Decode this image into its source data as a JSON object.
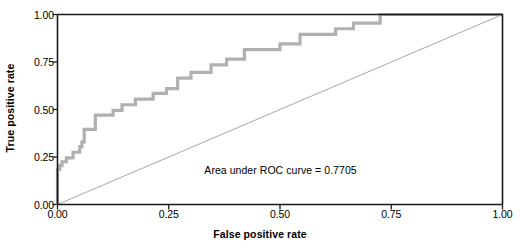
{
  "chart_data": {
    "type": "line",
    "title": "",
    "xlabel": "False positive rate",
    "ylabel": "True positive rate",
    "xlim": [
      0.0,
      1.0
    ],
    "ylim": [
      0.0,
      1.0
    ],
    "xticks": [
      "0.00",
      "0.25",
      "0.50",
      "0.75",
      "1.00"
    ],
    "xtick_values": [
      0.0,
      0.25,
      0.5,
      0.75,
      1.0
    ],
    "yticks": [
      "0.00",
      "0.25",
      "0.50",
      "0.75",
      "1.00"
    ],
    "ytick_values": [
      0.0,
      0.25,
      0.5,
      0.75,
      1.0
    ],
    "grid": false,
    "legend": "none",
    "annotation": {
      "text": "Area under ROC curve = 0.7705",
      "x": 0.33,
      "y": 0.175
    },
    "auc": 0.7705,
    "series": [
      {
        "name": "ROC curve",
        "type": "step",
        "color": "#b0b0b0",
        "linewidth": 3.2,
        "x": [
          0.0,
          0.0,
          0.0,
          0.0,
          0.0,
          0.0,
          0.0,
          0.0,
          0.005,
          0.005,
          0.01,
          0.01,
          0.02,
          0.02,
          0.035,
          0.035,
          0.05,
          0.05,
          0.055,
          0.055,
          0.06,
          0.06,
          0.085,
          0.085,
          0.125,
          0.125,
          0.145,
          0.145,
          0.175,
          0.175,
          0.215,
          0.215,
          0.245,
          0.245,
          0.27,
          0.27,
          0.3,
          0.3,
          0.345,
          0.345,
          0.38,
          0.38,
          0.42,
          0.42,
          0.5,
          0.5,
          0.545,
          0.545,
          0.625,
          0.625,
          0.665,
          0.665,
          0.725,
          0.725,
          1.0
        ],
        "y": [
          0.0,
          0.025,
          0.055,
          0.08,
          0.105,
          0.13,
          0.155,
          0.185,
          0.185,
          0.205,
          0.205,
          0.225,
          0.225,
          0.245,
          0.245,
          0.275,
          0.275,
          0.305,
          0.305,
          0.33,
          0.33,
          0.395,
          0.395,
          0.47,
          0.47,
          0.495,
          0.495,
          0.525,
          0.525,
          0.555,
          0.555,
          0.585,
          0.585,
          0.61,
          0.61,
          0.665,
          0.665,
          0.695,
          0.695,
          0.735,
          0.735,
          0.765,
          0.765,
          0.815,
          0.815,
          0.845,
          0.845,
          0.895,
          0.895,
          0.925,
          0.925,
          0.955,
          0.955,
          1.0,
          1.0
        ]
      },
      {
        "name": "reference diagonal",
        "type": "line",
        "color": "#909090",
        "linewidth": 0.8,
        "x": [
          0.0,
          1.0
        ],
        "y": [
          0.0,
          1.0
        ]
      }
    ]
  },
  "axes": {
    "y_title": "True positive rate",
    "x_title": "False positive rate",
    "frame_color": "#1a1a1a"
  },
  "colors": {
    "background": "#ffffff",
    "curve": "#b0b0b0",
    "diagonal": "#909090",
    "axis": "#1a1a1a",
    "text": "#000000"
  }
}
